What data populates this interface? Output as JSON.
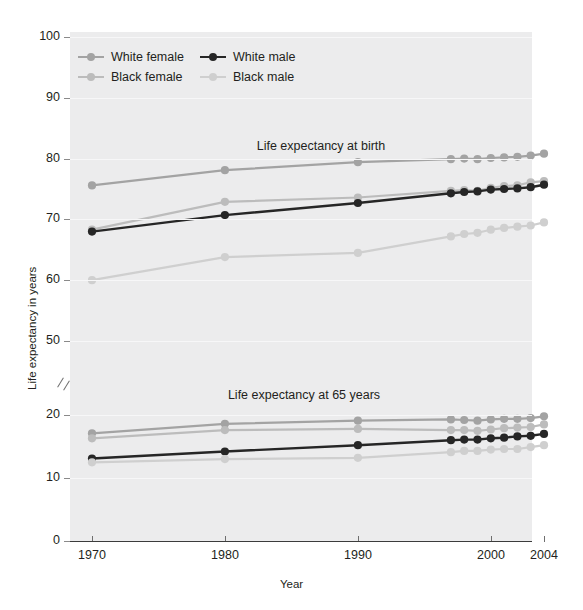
{
  "axes": {
    "ylabel": "Life expectancy in years",
    "xlabel": "Year",
    "y_ticks_upper": [
      "100",
      "90",
      "80",
      "70",
      "60",
      "50"
    ],
    "y_ticks_lower": [
      "20",
      "10",
      "0"
    ],
    "x_ticks": [
      "1970",
      "1980",
      "1990",
      "2000",
      "2004"
    ]
  },
  "panels": {
    "upper_title": "Life expectancy at birth",
    "lower_title": "Life expectancy at 65 years"
  },
  "legend": {
    "items": [
      {
        "label": "White female",
        "color": "#a3a3a3"
      },
      {
        "label": "Black female",
        "color": "#bcbcbc"
      },
      {
        "label": "White male",
        "color": "#262626"
      },
      {
        "label": "Black male",
        "color": "#cfcfcf"
      }
    ]
  },
  "colors": {
    "background": "#ececed",
    "gridline": "#f7f7f8",
    "axis": "#3c3c3c",
    "white_female": "#a3a3a3",
    "black_female": "#bcbcbc",
    "white_male": "#262626",
    "black_male": "#cfcfcf"
  },
  "chart_data": {
    "type": "line",
    "xlabel": "Year",
    "ylabel": "Life expectancy in years",
    "xlim": [
      1970,
      2004
    ],
    "ylim_upper": [
      50,
      100
    ],
    "ylim_lower": [
      0,
      20
    ],
    "grid": true,
    "legend_position": "top-left",
    "note": "Broken y-axis between 50 and 20; upper panel = life expectancy at birth, lower panel = life expectancy at 65 years.",
    "panels": [
      {
        "name": "Life expectancy at birth",
        "x": [
          1970,
          1980,
          1990,
          1997,
          1998,
          1999,
          2000,
          2001,
          2002,
          2003,
          2004
        ],
        "series": [
          {
            "name": "White female",
            "color": "#a3a3a3",
            "values": [
              75.6,
              78.1,
              79.4,
              79.9,
              80.0,
              79.9,
              80.1,
              80.2,
              80.3,
              80.5,
              80.8
            ]
          },
          {
            "name": "Black female",
            "color": "#bcbcbc",
            "values": [
              68.3,
              72.9,
              73.6,
              74.7,
              74.8,
              74.7,
              75.2,
              75.5,
              75.6,
              76.1,
              76.3
            ]
          },
          {
            "name": "White male",
            "color": "#262626",
            "values": [
              68.0,
              70.7,
              72.7,
              74.3,
              74.5,
              74.6,
              74.9,
              75.0,
              75.1,
              75.3,
              75.7
            ]
          },
          {
            "name": "Black male",
            "color": "#cfcfcf",
            "values": [
              60.0,
              63.8,
              64.5,
              67.2,
              67.6,
              67.8,
              68.3,
              68.6,
              68.8,
              69.0,
              69.5
            ]
          }
        ]
      },
      {
        "name": "Life expectancy at 65 years",
        "x": [
          1970,
          1980,
          1990,
          1997,
          1998,
          1999,
          2000,
          2001,
          2002,
          2003,
          2004
        ],
        "series": [
          {
            "name": "White female",
            "color": "#a3a3a3",
            "values": [
              17.1,
              18.6,
              19.1,
              19.3,
              19.2,
              19.1,
              19.3,
              19.4,
              19.4,
              19.5,
              19.8
            ]
          },
          {
            "name": "Black female",
            "color": "#bcbcbc",
            "values": [
              16.3,
              17.6,
              17.8,
              17.6,
              17.6,
              17.5,
              17.7,
              17.9,
              18.0,
              18.1,
              18.5
            ]
          },
          {
            "name": "White male",
            "color": "#262626",
            "values": [
              13.1,
              14.2,
              15.2,
              16.0,
              16.1,
              16.1,
              16.3,
              16.4,
              16.6,
              16.7,
              17.0
            ]
          },
          {
            "name": "Black male",
            "color": "#cfcfcf",
            "values": [
              12.5,
              13.0,
              13.2,
              14.1,
              14.3,
              14.3,
              14.5,
              14.6,
              14.6,
              14.9,
              15.2
            ]
          }
        ]
      }
    ]
  }
}
